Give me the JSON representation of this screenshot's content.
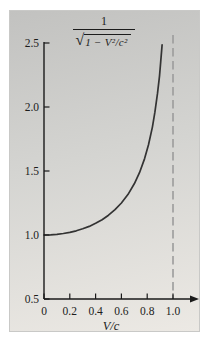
{
  "figure": {
    "xaxis_label": "V/c",
    "formula": {
      "numerator": "1",
      "radical_sign": "√",
      "radicand": "1 − V²/c²"
    }
  },
  "chart_data": {
    "type": "line",
    "title": "",
    "xlabel": "V/c",
    "ylabel": "1/sqrt(1 - V^2/c^2)",
    "xlim": [
      0,
      1.18
    ],
    "ylim": [
      0.5,
      2.5
    ],
    "grid": false,
    "legend": "none",
    "x_ticks": {
      "values": [
        0,
        0.2,
        0.4,
        0.6,
        0.8,
        1.0
      ],
      "labels": [
        "0",
        "0.2",
        "0.4",
        "0.6",
        "0.8",
        "1.0"
      ]
    },
    "y_ticks": {
      "values": [
        2.5,
        2.0,
        1.5,
        1.0,
        0.5
      ],
      "labels": [
        "2.5",
        "2.0",
        "1.5",
        "1.0",
        "0.5"
      ]
    },
    "asymptote_x": 1.0,
    "series": [
      {
        "name": "lorentz-factor",
        "x": [
          0,
          0.05,
          0.1,
          0.15,
          0.2,
          0.25,
          0.3,
          0.35,
          0.4,
          0.45,
          0.5,
          0.55,
          0.6,
          0.65,
          0.7,
          0.74,
          0.78,
          0.81,
          0.84,
          0.86,
          0.88,
          0.895,
          0.905,
          0.9155
        ],
        "y": [
          1.0,
          1.0013,
          1.005,
          1.0114,
          1.0206,
          1.0328,
          1.0483,
          1.0675,
          1.0911,
          1.1198,
          1.1547,
          1.1974,
          1.25,
          1.3159,
          1.4003,
          1.4866,
          1.5972,
          1.7053,
          1.843,
          1.9597,
          2.1066,
          2.2417,
          2.3527,
          2.4853
        ]
      }
    ],
    "colors": {
      "curve": "#333333",
      "axis": "#1a1a1a",
      "asymptote": "#9c9c9c",
      "panel_top": "#c2c2c0",
      "panel_bottom": "#ece9e4"
    }
  }
}
